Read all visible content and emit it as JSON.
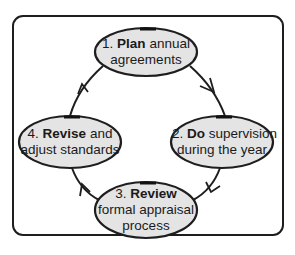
{
  "diagram": {
    "type": "cycle",
    "colors": {
      "ellipse_fill": "#e4e4e4",
      "stroke": "#1e1e1e",
      "text": "#1a1a1a",
      "frame": "#1e1e1e"
    },
    "nodes": [
      {
        "id": 1,
        "number": "1.",
        "keyword": "Plan",
        "rest_line1": "annual",
        "line2": "agreements",
        "line3": ""
      },
      {
        "id": 2,
        "number": "2.",
        "keyword": "Do",
        "rest_line1": "supervision",
        "line2": "during the year",
        "line3": ""
      },
      {
        "id": 3,
        "number": "3.",
        "keyword": "Review",
        "rest_line1": "",
        "line2": "formal appraisal",
        "line3": "process"
      },
      {
        "id": 4,
        "number": "4.",
        "keyword": "Revise",
        "rest_line1": "and",
        "line2": "adjust standards",
        "line3": ""
      }
    ],
    "edges": [
      {
        "from": 1,
        "to": 2,
        "direction": "clockwise"
      },
      {
        "from": 2,
        "to": 3,
        "direction": "clockwise"
      },
      {
        "from": 3,
        "to": 4,
        "direction": "clockwise"
      },
      {
        "from": 4,
        "to": 1,
        "direction": "clockwise"
      }
    ]
  }
}
